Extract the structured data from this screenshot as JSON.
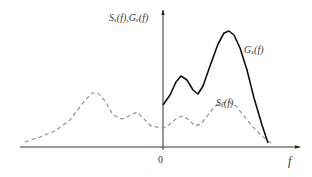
{
  "chart_data": {
    "type": "line",
    "title": "",
    "xlabel": "f",
    "ylabel": "S_x(f), G_x(f)",
    "x_ticks": [
      "0"
    ],
    "grid": false,
    "legend": "inline annotations",
    "series": [
      {
        "name": "G_x(f)",
        "style": "solid",
        "color": "#111111",
        "domain": "f >= 0 (one-sided)",
        "points_px": [
          [
            163,
            105
          ],
          [
            170,
            95
          ],
          [
            176,
            82
          ],
          [
            181,
            76
          ],
          [
            187,
            80
          ],
          [
            193,
            90
          ],
          [
            198,
            94
          ],
          [
            203,
            86
          ],
          [
            210,
            66
          ],
          [
            218,
            44
          ],
          [
            224,
            33
          ],
          [
            229,
            31
          ],
          [
            234,
            35
          ],
          [
            240,
            48
          ],
          [
            247,
            70
          ],
          [
            254,
            98
          ],
          [
            262,
            125
          ],
          [
            268,
            143
          ]
        ]
      },
      {
        "name": "S_x(f)",
        "style": "dashed",
        "color": "#888888",
        "domain": "two-sided, symmetric about f = 0",
        "points_px": [
          [
            25,
            142
          ],
          [
            40,
            137
          ],
          [
            55,
            131
          ],
          [
            70,
            120
          ],
          [
            82,
            104
          ],
          [
            92,
            93
          ],
          [
            98,
            93
          ],
          [
            105,
            101
          ],
          [
            113,
            115
          ],
          [
            122,
            119
          ],
          [
            131,
            115
          ],
          [
            137,
            112
          ],
          [
            143,
            118
          ],
          [
            151,
            126
          ],
          [
            163,
            128
          ],
          [
            170,
            124
          ],
          [
            177,
            118
          ],
          [
            183,
            116
          ],
          [
            189,
            120
          ],
          [
            195,
            126
          ],
          [
            201,
            124
          ],
          [
            208,
            115
          ],
          [
            215,
            106
          ],
          [
            222,
            103
          ],
          [
            229,
            102
          ],
          [
            236,
            106
          ],
          [
            244,
            116
          ],
          [
            252,
            126
          ],
          [
            262,
            136
          ],
          [
            272,
            144
          ]
        ]
      }
    ],
    "annotations": [
      {
        "text": "G_x(f)",
        "near": "right flank of solid peak"
      },
      {
        "text": "S_x(f)",
        "near": "right-side dashed peak"
      }
    ]
  },
  "labels": {
    "y_axis_label": "Sₓ(f),Gₓ(f)",
    "x_axis_label": "f",
    "origin_tick": "0",
    "g_curve_label": "Gₓ(f)",
    "s_curve_label": "Sₓ(f)"
  }
}
